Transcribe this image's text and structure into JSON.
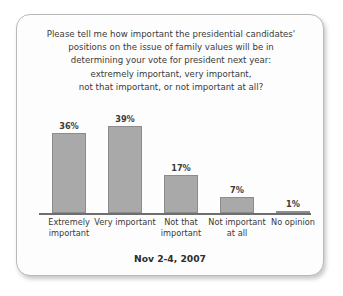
{
  "card": {
    "title_lines": [
      "Please tell me how important the presidential candidates'",
      "positions on the issue of family values will be in",
      "determining your vote for president next year:",
      "extremely important, very important,",
      "not that important, or not important at all?"
    ],
    "date_caption": "Nov 2-4, 2007"
  },
  "chart_data": {
    "type": "bar",
    "subtitle": "Nov 2-4, 2007",
    "categories": [
      "Extremely important",
      "Very important",
      "Not that important",
      "Not important at all",
      "No opinion"
    ],
    "category_lines": [
      [
        "Extremely",
        "important"
      ],
      [
        "Very important"
      ],
      [
        "Not that",
        "important"
      ],
      [
        "Not important",
        "at all"
      ],
      [
        "No opinion"
      ]
    ],
    "values": [
      36,
      39,
      17,
      7,
      1
    ],
    "value_labels": [
      "36%",
      "39%",
      "17%",
      "7%",
      "1%"
    ],
    "xlabel": "",
    "ylabel": "",
    "ylim": [
      0,
      45
    ],
    "grid": false,
    "legend": "none",
    "bar_color": "#a9a9a9",
    "bar_border_color": "#8c8c8c",
    "axis_color": "#6e6e6e",
    "text_color": "#3a3a3a"
  }
}
